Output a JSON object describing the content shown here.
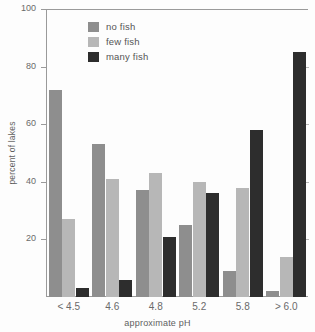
{
  "chart_data": {
    "type": "bar",
    "title": "",
    "xlabel": "approximate pH",
    "ylabel": "percent of lakes",
    "categories": [
      "< 4.5",
      "4.6",
      "4.8",
      "5.2",
      "5.8",
      "> 6.0"
    ],
    "series": [
      {
        "name": "no fish",
        "color": "#8e8e8e",
        "values": [
          72,
          53,
          37,
          25,
          9,
          2
        ]
      },
      {
        "name": "few fish",
        "color": "#b7b7b7",
        "values": [
          27,
          41,
          43,
          40,
          38,
          14
        ]
      },
      {
        "name": "many fish",
        "color": "#2d2d2d",
        "values": [
          3,
          6,
          21,
          36,
          58,
          85
        ]
      }
    ],
    "ylim": [
      0,
      100
    ],
    "yticks": [
      0,
      20,
      40,
      60,
      80,
      100
    ],
    "ytick_labels": [
      "",
      "20",
      "40",
      "60",
      "80",
      "100"
    ],
    "grid": false,
    "legend_position": "upper-left-inside"
  },
  "axes": {
    "y_title": "percent of lakes",
    "x_title": "approximate pH"
  },
  "legend": {
    "items": [
      {
        "label": "no fish"
      },
      {
        "label": "few fish"
      },
      {
        "label": "many fish"
      }
    ]
  }
}
